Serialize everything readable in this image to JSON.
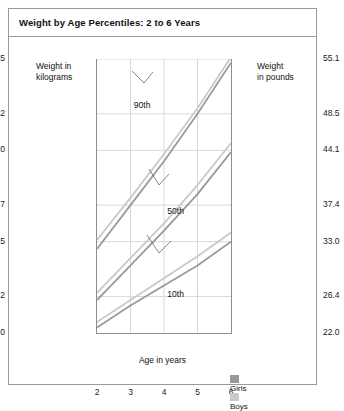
{
  "chart_data": {
    "type": "line",
    "title": "Weight by Age Percentiles: 2 to 6 Years",
    "xlabel": "Age in years",
    "ylabel_left": "Weight in kilograms",
    "ylabel_right": "Weight in pounds",
    "x": [
      2,
      3,
      4,
      5,
      6
    ],
    "xlim": [
      2,
      6
    ],
    "xticks": [
      "2",
      "3",
      "4",
      "5",
      "6"
    ],
    "ylim_kg": [
      10,
      25
    ],
    "yticks_kg": [
      "10",
      "12",
      "15",
      "17",
      "20",
      "22",
      "25"
    ],
    "ytick_values_kg": [
      10,
      12,
      15,
      17,
      20,
      22,
      25
    ],
    "yticks_lb": [
      "22.0",
      "26.4",
      "33.0",
      "37.4",
      "44.1",
      "48.5",
      "55.1"
    ],
    "grid": true,
    "legend_position": "bottom-inside",
    "legend": [
      {
        "name": "Girls",
        "color": "#9a9a9a"
      },
      {
        "name": "Boys",
        "color": "#c9c9c9"
      }
    ],
    "annotations": [
      {
        "label": "90th",
        "x": 3.1,
        "y": 22.4
      },
      {
        "label": "50th",
        "x": 4.1,
        "y": 16.6
      },
      {
        "label": "10th",
        "x": 4.1,
        "y": 12.1
      }
    ],
    "series": [
      {
        "name": "Girls 90th",
        "percentile": "90th",
        "sex": "Girls",
        "color": "#9a9a9a",
        "values_kg": [
          14.6,
          17.0,
          19.4,
          22.0,
          24.8
        ]
      },
      {
        "name": "Boys 90th",
        "percentile": "90th",
        "sex": "Boys",
        "color": "#c9c9c9",
        "values_kg": [
          15.1,
          17.4,
          19.8,
          22.3,
          25.1
        ]
      },
      {
        "name": "Girls 50th",
        "percentile": "50th",
        "sex": "Girls",
        "color": "#9a9a9a",
        "values_kg": [
          11.8,
          13.7,
          15.6,
          17.6,
          19.9
        ]
      },
      {
        "name": "Boys 50th",
        "percentile": "50th",
        "sex": "Boys",
        "color": "#c9c9c9",
        "values_kg": [
          12.2,
          14.1,
          16.0,
          18.1,
          20.4
        ]
      },
      {
        "name": "Girls 10th",
        "percentile": "10th",
        "sex": "Girls",
        "color": "#9a9a9a",
        "values_kg": [
          10.3,
          11.5,
          12.6,
          13.7,
          15.0
        ]
      },
      {
        "name": "Boys 10th",
        "percentile": "10th",
        "sex": "Boys",
        "color": "#c9c9c9",
        "values_kg": [
          10.6,
          11.8,
          13.0,
          14.2,
          15.5
        ]
      }
    ]
  }
}
